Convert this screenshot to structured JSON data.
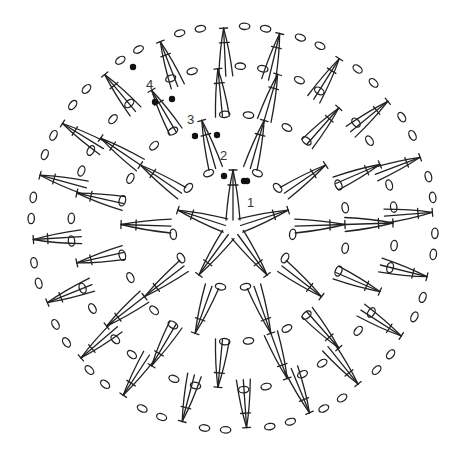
{
  "diagram": {
    "type": "crochet-chart",
    "title": "",
    "symbols": {
      "cluster": "3-double-crochet cluster",
      "chain": "chain stitch",
      "slip_stitch": "slip stitch"
    },
    "rounds": [
      {
        "label": "1",
        "clusters": 5,
        "chains_between": 2,
        "start_chains": 3
      },
      {
        "label": "2",
        "clusters": 10,
        "chains_between": 2,
        "start_chains": 3
      },
      {
        "label": "3",
        "clusters": 15,
        "chains_between": 2,
        "start_chains": 3
      },
      {
        "label": "4",
        "clusters": 20,
        "chains_between": 2,
        "start_chains": 3
      }
    ],
    "outer_chain_ring": {
      "chains_between_clusters": 2
    }
  }
}
